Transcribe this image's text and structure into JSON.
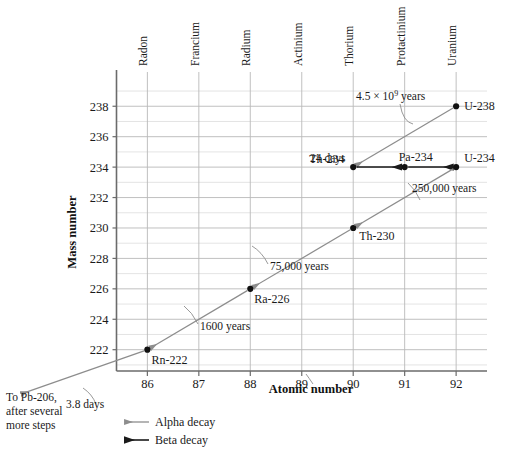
{
  "chart_data": {
    "type": "scatter",
    "xlabel": "Atomic number",
    "ylabel": "Mass number",
    "xlim": [
      85.4,
      92.6
    ],
    "ylim": [
      220.6,
      239.2
    ],
    "xticks": [
      86,
      87,
      88,
      89,
      90,
      91,
      92
    ],
    "yticks": [
      222,
      224,
      226,
      228,
      230,
      232,
      234,
      236,
      238
    ],
    "grid": true,
    "legend_position": "bottom-left",
    "element_names": [
      {
        "z": 86,
        "name": "Radon"
      },
      {
        "z": 87,
        "name": "Francium"
      },
      {
        "z": 88,
        "name": "Radium"
      },
      {
        "z": 89,
        "name": "Actinium"
      },
      {
        "z": 90,
        "name": "Thorium"
      },
      {
        "z": 91,
        "name": "Protactinium"
      },
      {
        "z": 92,
        "name": "Uranium"
      }
    ],
    "points": [
      {
        "label": "U-238",
        "z": 92,
        "a": 238,
        "label_dx": 8,
        "label_dy": 4
      },
      {
        "label": "Th-234",
        "z": 90,
        "a": 234,
        "label_dx": -44,
        "label_dy": -4
      },
      {
        "label": "Pa-234",
        "z": 91,
        "a": 234,
        "label_dx": -6,
        "label_dy": -6
      },
      {
        "label": "U-234",
        "z": 92,
        "a": 234,
        "label_dx": 8,
        "label_dy": -5
      },
      {
        "label": "Th-230",
        "z": 90,
        "a": 230,
        "label_dx": 6,
        "label_dy": 12
      },
      {
        "label": "Ra-226",
        "z": 88,
        "a": 226,
        "label_dx": 4,
        "label_dy": 14
      },
      {
        "label": "Rn-222",
        "z": 86,
        "a": 222,
        "label_dx": 4,
        "label_dy": 14
      }
    ],
    "transitions": [
      {
        "from": "U-238",
        "to": "Th-234",
        "type": "alpha",
        "halflife": "4.5 × 10⁹ years"
      },
      {
        "from": "Th-234",
        "to": "Pa-234",
        "type": "beta",
        "halflife": "24 days"
      },
      {
        "from": "Pa-234",
        "to": "U-234",
        "type": "beta",
        "halflife": ""
      },
      {
        "from": "U-234",
        "to": "Th-230",
        "type": "alpha",
        "halflife": "250,000 years"
      },
      {
        "from": "Th-230",
        "to": "Ra-226",
        "type": "alpha",
        "halflife": "75,000 years"
      },
      {
        "from": "Ra-226",
        "to": "Rn-222",
        "type": "alpha",
        "halflife": "1600 years"
      },
      {
        "from": "Rn-222",
        "to": "off-chart",
        "type": "alpha",
        "halflife": "3.8 days"
      }
    ],
    "annotations": {
      "a_45e9": "4.5 × 10",
      "a_45e9_exp": "9",
      "a_45e9_tail": " years",
      "a_24days": "24 days",
      "a_250k": "250,000 years",
      "a_75k": "75,000 years",
      "a_1600": "1600 years",
      "a_38days": "3.8 days"
    },
    "note": {
      "line1": "To Pb-206,",
      "line2": "after several",
      "line3": "more steps"
    },
    "legend": [
      {
        "key": "alpha",
        "label": "Alpha decay",
        "color": "#8d8d8d"
      },
      {
        "key": "beta",
        "label": "Beta decay",
        "color": "#1a1a1a"
      }
    ],
    "colors": {
      "alpha": "#8d8d8d",
      "beta": "#1a1a1a",
      "axis": "#6b6b6b",
      "grid_major": "#b9b9b9",
      "grid_minor": "#d8d8d8",
      "point": "#111111",
      "background": "#ffffff"
    }
  }
}
